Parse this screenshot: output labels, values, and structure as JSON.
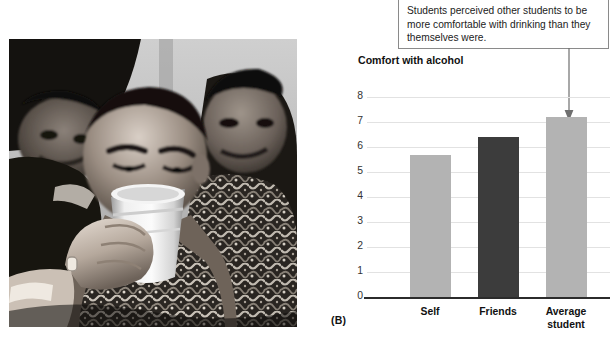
{
  "figure": {
    "label": "(B)"
  },
  "callout": {
    "text": "Students perceived other students to be more comfortable with drinking than they themselves were.",
    "arrow_icon": "down-arrow-icon"
  },
  "photo": {
    "alt": "Black-and-white photograph of a young man drinking from a plastic cup while surrounded by other students",
    "treatment": "grayscale"
  },
  "chart_data": {
    "type": "bar",
    "title": "Comfort with alcohol",
    "ylabel": "Comfort with alcohol",
    "xlabel": "",
    "categories": [
      "Self",
      "Friends",
      "Average student"
    ],
    "values": [
      5.7,
      6.4,
      7.2
    ],
    "bar_colors": [
      "#b3b3b3",
      "#3c3c3c",
      "#b3b3b3"
    ],
    "ylim": [
      0,
      8
    ],
    "yticks": [
      0,
      1,
      2,
      3,
      4,
      5,
      6,
      7,
      8
    ],
    "ytick_labels": [
      "0",
      "1",
      "2",
      "3",
      "4",
      "5",
      "6",
      "7",
      "8"
    ],
    "grid": true,
    "legend": null,
    "annotations": [
      {
        "text": "Students perceived other students to be more comfortable with drinking than they themselves were.",
        "points_to": "Average student"
      }
    ]
  },
  "colors": {
    "bar_light": "#b3b3b3",
    "bar_dark": "#3c3c3c",
    "gridline": "#e2e2e2",
    "axis": "#2b2b2b",
    "callout_border": "#8a8a8a",
    "text": "#111111"
  }
}
